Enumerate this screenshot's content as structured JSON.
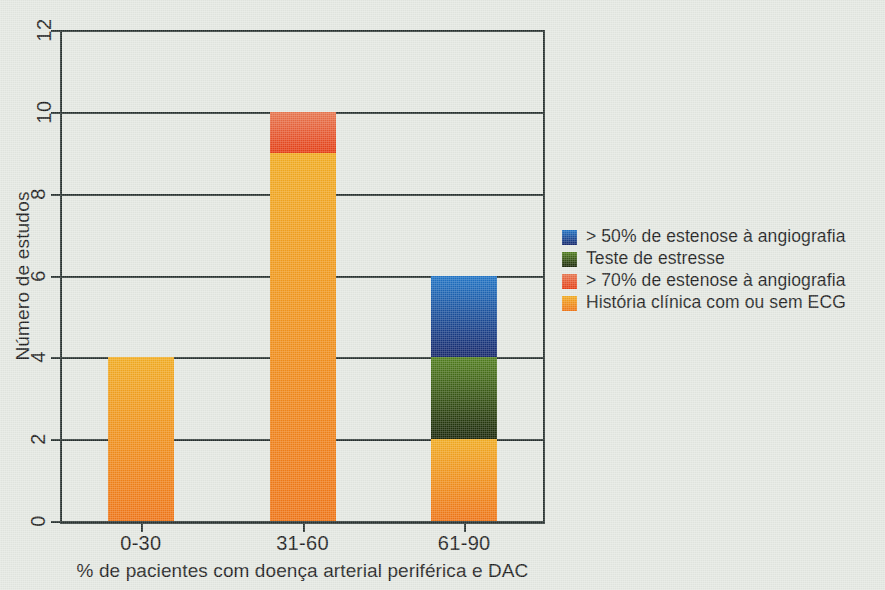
{
  "chart_data": {
    "type": "bar",
    "subtype": "stacked-vertical-bar",
    "title": "",
    "xlabel": "% de pacientes com doença arterial periférica e DAC",
    "ylabel": "Número de estudos",
    "categories": [
      "0-30",
      "31-60",
      "61-90"
    ],
    "ylim": [
      0,
      12
    ],
    "yticks": [
      0,
      2,
      4,
      6,
      8,
      10,
      12
    ],
    "ytick_labels": [
      "0",
      "2",
      "4",
      "6",
      "8",
      "10",
      "12"
    ],
    "grid": true,
    "grid_axis": "y",
    "legend_position": "right",
    "stack_order_bottom_to_top": [
      "História clínica com ou sem ECG",
      "Teste de estresse",
      "> 50% de estenose à angiografia",
      "> 70% de estenose à angiografia"
    ],
    "series": [
      {
        "name": "> 50% de estenose à angiografia",
        "color": "#1c55a8",
        "color_top": "#1f74c6",
        "color_bottom": "#14256a",
        "values": [
          0,
          0,
          2
        ]
      },
      {
        "name": "Teste de estresse",
        "color": "#38591a",
        "color_top": "#517f1d",
        "color_bottom": "#192508",
        "values": [
          0,
          0,
          2
        ]
      },
      {
        "name": "> 70% de estenose à angiografia",
        "color": "#e8491f",
        "color_top": "#e8764f",
        "color_bottom": "#e63c12",
        "values": [
          0,
          1,
          0
        ]
      },
      {
        "name": "História clínica com ou sem ECG",
        "color": "#f08c1a",
        "color_top": "#f2ac21",
        "color_bottom": "#f07516",
        "values": [
          4,
          9,
          2
        ]
      }
    ],
    "bar_totals": [
      4,
      10,
      6
    ],
    "bars": [
      {
        "category": "0-30",
        "total": 4,
        "segments": [
          {
            "series": "História clínica com ou sem ECG",
            "from": 0,
            "to": 4,
            "value": 4
          }
        ]
      },
      {
        "category": "31-60",
        "total": 10,
        "segments": [
          {
            "series": "História clínica com ou sem ECG",
            "from": 0,
            "to": 9,
            "value": 9
          },
          {
            "series": "> 70% de estenose à angiografia",
            "from": 9,
            "to": 10,
            "value": 1
          }
        ]
      },
      {
        "category": "61-90",
        "total": 6,
        "segments": [
          {
            "series": "História clínica com ou sem ECG",
            "from": 0,
            "to": 2,
            "value": 2
          },
          {
            "series": "Teste de estresse",
            "from": 2,
            "to": 4,
            "value": 2
          },
          {
            "series": "> 50% de estenose à angiografia",
            "from": 4,
            "to": 6,
            "value": 2
          }
        ]
      }
    ]
  },
  "legend": {
    "items": [
      {
        "label": "> 50% de estenose à angiografia",
        "color_top": "#1f74c6",
        "color_bottom": "#14256a"
      },
      {
        "label": "Teste de estresse",
        "color_top": "#517f1d",
        "color_bottom": "#192508"
      },
      {
        "label": "> 70% de estenose à angiografia",
        "color_top": "#e8764f",
        "color_bottom": "#e63c12"
      },
      {
        "label": "História clínica com ou sem ECG",
        "color_top": "#f2ac21",
        "color_bottom": "#f07516"
      }
    ]
  },
  "colors": {
    "background": "#e4e8e2",
    "axis": "#26302e",
    "text": "#1c1c1c"
  }
}
